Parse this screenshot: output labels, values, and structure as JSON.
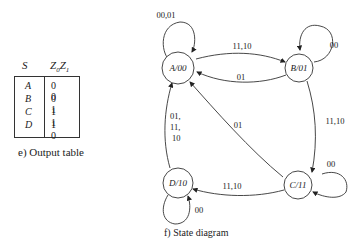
{
  "output_table": {
    "header_state": "S",
    "header_output": "Z0Z1",
    "rows": [
      {
        "state": "A",
        "output": "0 0"
      },
      {
        "state": "B",
        "output": "0 1"
      },
      {
        "state": "C",
        "output": "1 1"
      },
      {
        "state": "D",
        "output": "1 0"
      }
    ],
    "caption": "e)  Output table"
  },
  "state_diagram": {
    "caption": "f)  State diagram",
    "states": [
      {
        "id": "A",
        "label": "A/00"
      },
      {
        "id": "B",
        "label": "B/01"
      },
      {
        "id": "C",
        "label": "C/11"
      },
      {
        "id": "D",
        "label": "D/10"
      }
    ],
    "transitions": [
      {
        "from": "A",
        "to": "A",
        "label": "00,01"
      },
      {
        "from": "A",
        "to": "B",
        "label": "11,10"
      },
      {
        "from": "B",
        "to": "A",
        "label": "01"
      },
      {
        "from": "B",
        "to": "B",
        "label": "00"
      },
      {
        "from": "B",
        "to": "C",
        "label": "11,10"
      },
      {
        "from": "C",
        "to": "C",
        "label": "00"
      },
      {
        "from": "C",
        "to": "A",
        "label": "01"
      },
      {
        "from": "C",
        "to": "D",
        "label": "11,10"
      },
      {
        "from": "D",
        "to": "D",
        "label": "00"
      },
      {
        "from": "D",
        "to": "A",
        "label_lines": [
          "01,",
          "11,",
          "10"
        ]
      }
    ]
  }
}
